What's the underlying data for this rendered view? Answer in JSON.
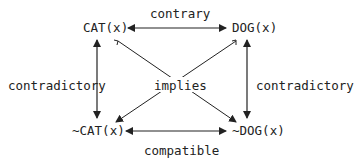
{
  "nodes": {
    "cat": "CAT(x)",
    "dog": "DOG(x)",
    "not_cat": "~CAT(x)",
    "not_dog": "~DOG(x)"
  },
  "relations": {
    "top": "contrary",
    "bottom": "compatible",
    "left": "contradictory",
    "right": "contradictory",
    "center": "implies"
  },
  "colors": {
    "ink": "#222222",
    "background": "#ffffff"
  }
}
